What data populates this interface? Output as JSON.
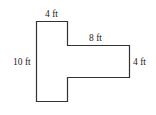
{
  "diagram": {
    "type": "T-shaped polygon floor plan",
    "stroke_color": "#333333",
    "fill_color": "#ffffff",
    "labels": {
      "top_width": "4 ft",
      "arm_length": "8 ft",
      "left_height": "10 ft",
      "arm_height": "4 ft"
    }
  }
}
